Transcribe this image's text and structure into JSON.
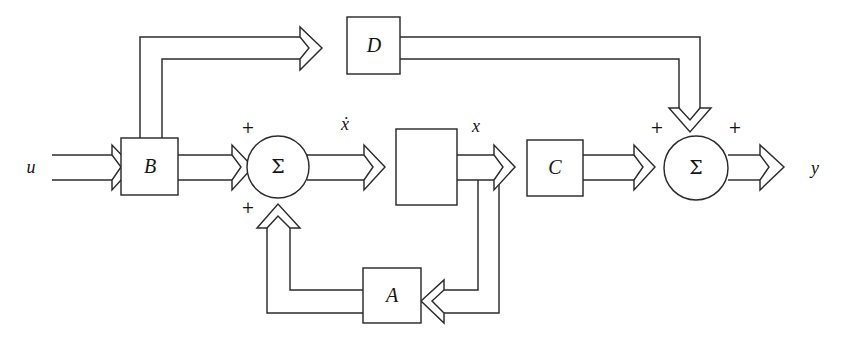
{
  "diagram": {
    "type": "control-system-block-diagram",
    "stroke_color": "#2b2b2b",
    "background_color": "#ffffff",
    "blocks": [
      {
        "id": "B",
        "label": "B",
        "shape": "rectangle"
      },
      {
        "id": "D",
        "label": "D",
        "shape": "rectangle"
      },
      {
        "id": "A",
        "label": "A",
        "shape": "rectangle"
      },
      {
        "id": "C",
        "label": "C",
        "shape": "rectangle"
      },
      {
        "id": "integrator",
        "label": "",
        "shape": "rectangle"
      }
    ],
    "summing_junctions": [
      {
        "id": "sum-left",
        "label": "Σ"
      },
      {
        "id": "sum-right",
        "label": "Σ"
      }
    ],
    "signals": {
      "input": "u",
      "state_derivative": "ẋ",
      "state": "x",
      "output": "y"
    },
    "signs": {
      "sum_left_top": "+",
      "sum_left_bottom": "+",
      "sum_right_left": "+",
      "sum_right_right": "+"
    }
  }
}
